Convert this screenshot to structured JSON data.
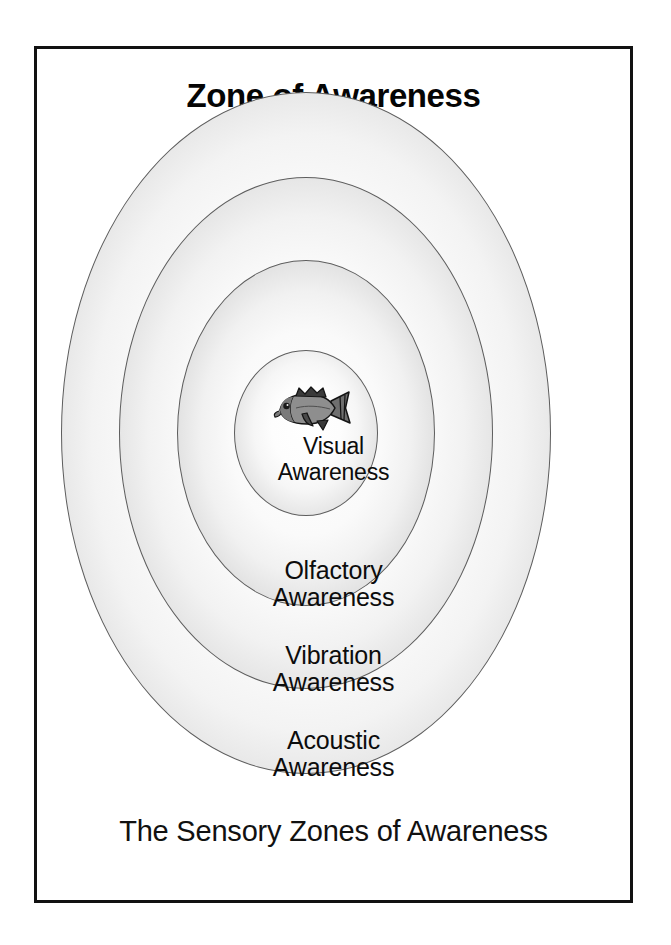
{
  "figure": {
    "title": "Zone of Awareness",
    "caption": "The Sensory Zones of Awareness",
    "background_color": "#ffffff",
    "frame_color": "#111111",
    "text_color": "#0c0c0c",
    "ring_outline_color": "#5d5d5d",
    "ring_gradient_light": "#ffffff",
    "ring_gradient_dark": "#ababab"
  },
  "zones": [
    {
      "id": "acoustic",
      "order": 4,
      "position": "outermost",
      "label_line1": "Acoustic",
      "label_line2": "Awareness",
      "label": "Acoustic\nAwareness"
    },
    {
      "id": "vibration",
      "order": 3,
      "position": "third",
      "label_line1": "Vibration",
      "label_line2": "Awareness",
      "label": "Vibration\nAwareness"
    },
    {
      "id": "olfactory",
      "order": 2,
      "position": "second",
      "label_line1": "Olfactory",
      "label_line2": "Awareness",
      "label": "Olfactory\nAwareness"
    },
    {
      "id": "visual",
      "order": 1,
      "position": "innermost",
      "label_line1": "Visual",
      "label_line2": "Awareness",
      "label": "Visual\nAwareness"
    }
  ],
  "illustration": {
    "name": "fish-icon",
    "subject": "bass fish facing left",
    "body_color": "#8a8a8a",
    "outline_color": "#1a1a1a",
    "fin_color": "#2b2b2b"
  }
}
